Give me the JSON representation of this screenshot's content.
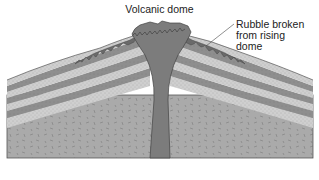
{
  "diagram": {
    "title": "Volcanic dome",
    "annotations": [
      {
        "id": "rubble",
        "lines": [
          "Rubble broken",
          "from rising",
          "dome"
        ]
      }
    ],
    "colors": {
      "light_layer": "#cdcdcd",
      "dark_layer": "#8c8c8c",
      "basement": "#a9a9a9",
      "conduit": "#7a7a7a",
      "rubble": "#6a6a6a",
      "outline": "#444444",
      "background": "#ffffff"
    }
  }
}
